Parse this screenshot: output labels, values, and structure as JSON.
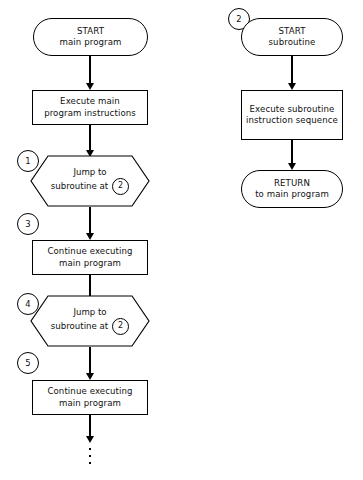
{
  "diagram": {
    "line_color": "#000000",
    "background_color": "#ffffff"
  },
  "main_column": {
    "start": {
      "line1": "START",
      "line2": "main program"
    },
    "execute": {
      "line1": "Execute main",
      "line2": "program instructions"
    },
    "jump1": {
      "connector": "1",
      "line1": "Jump to",
      "line2": "subroutine at",
      "target": "2"
    },
    "connector3": "3",
    "continue1": {
      "line1": "Continue executing",
      "line2": "main program"
    },
    "jump2": {
      "connector": "4",
      "line1": "Jump to",
      "line2": "subroutine at",
      "target": "2"
    },
    "connector5": "5",
    "continue2": {
      "line1": "Continue executing",
      "line2": "main program"
    },
    "ellipsis": "⋮"
  },
  "subroutine_column": {
    "entry_connector": "2",
    "start": {
      "line1": "START",
      "line2": "subroutine"
    },
    "execute": {
      "line1": "Execute subroutine",
      "line2": "instruction sequence"
    },
    "return": {
      "line1": "RETURN",
      "line2": "to main program"
    }
  }
}
